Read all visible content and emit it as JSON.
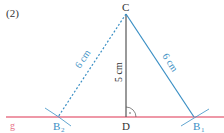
{
  "figure": {
    "label": "(2)",
    "line_name": "g",
    "points": {
      "C": "C",
      "D": "D",
      "B1": "B",
      "B1_sub": "1",
      "B2": "B",
      "B2_sub": "2"
    },
    "measurements": {
      "height_CD": "5 cm",
      "side_CB1": "6 cm",
      "side_CB2": "6 cm"
    },
    "colors": {
      "line_g": "#e8768a",
      "side": "#3a8fc4",
      "height": "#555555",
      "text": "#333333"
    }
  }
}
